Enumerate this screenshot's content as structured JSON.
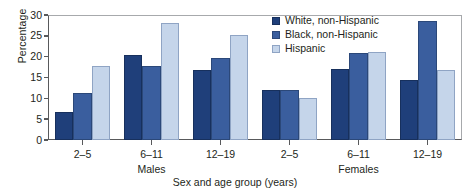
{
  "chart_data": {
    "type": "bar",
    "title": "",
    "subtitle": "",
    "xlabel": "Sex and age group (years)",
    "ylabel": "Percentage",
    "ylim": [
      0,
      30
    ],
    "yticks": [
      0,
      5,
      10,
      15,
      20,
      25,
      30
    ],
    "grid": false,
    "legend_position": "top-center-right",
    "categories": [
      "2–5",
      "6–11",
      "12–19",
      "2–5",
      "6–11",
      "12–19"
    ],
    "group_labels": [
      "Males",
      "Females"
    ],
    "series": [
      {
        "name": "White, non-Hispanic",
        "color": "#1F3F7A",
        "values": [
          6.8,
          20.4,
          16.7,
          11.9,
          17.0,
          14.3
        ]
      },
      {
        "name": "Black, non-Hispanic",
        "color": "#3A5E9E",
        "values": [
          11.3,
          17.7,
          19.7,
          11.9,
          20.9,
          28.6
        ]
      },
      {
        "name": "Hispanic",
        "color": "#C5D5EA",
        "values": [
          17.7,
          28.0,
          25.2,
          10.1,
          21.1,
          16.9
        ]
      }
    ]
  },
  "axes": {
    "y_title": "Percentage",
    "x_title": "Sex and age group (years)",
    "y_tick_labels": [
      "0",
      "5",
      "10",
      "15",
      "20",
      "25",
      "30"
    ]
  },
  "legend": {
    "items": [
      {
        "label": "White, non-Hispanic",
        "color": "#1F3F7A"
      },
      {
        "label": "Black, non-Hispanic",
        "color": "#3A5E9E"
      },
      {
        "label": "Hispanic",
        "color": "#C5D5EA"
      }
    ]
  },
  "x_groups": [
    {
      "age": "2–5",
      "sex": "Males"
    },
    {
      "age": "6–11",
      "sex": ""
    },
    {
      "age": "12–19",
      "sex": ""
    },
    {
      "age": "2–5",
      "sex": "Females"
    },
    {
      "age": "6–11",
      "sex": ""
    },
    {
      "age": "12–19",
      "sex": ""
    }
  ],
  "sex_labels": [
    {
      "label": "Males"
    },
    {
      "label": "Females"
    }
  ]
}
